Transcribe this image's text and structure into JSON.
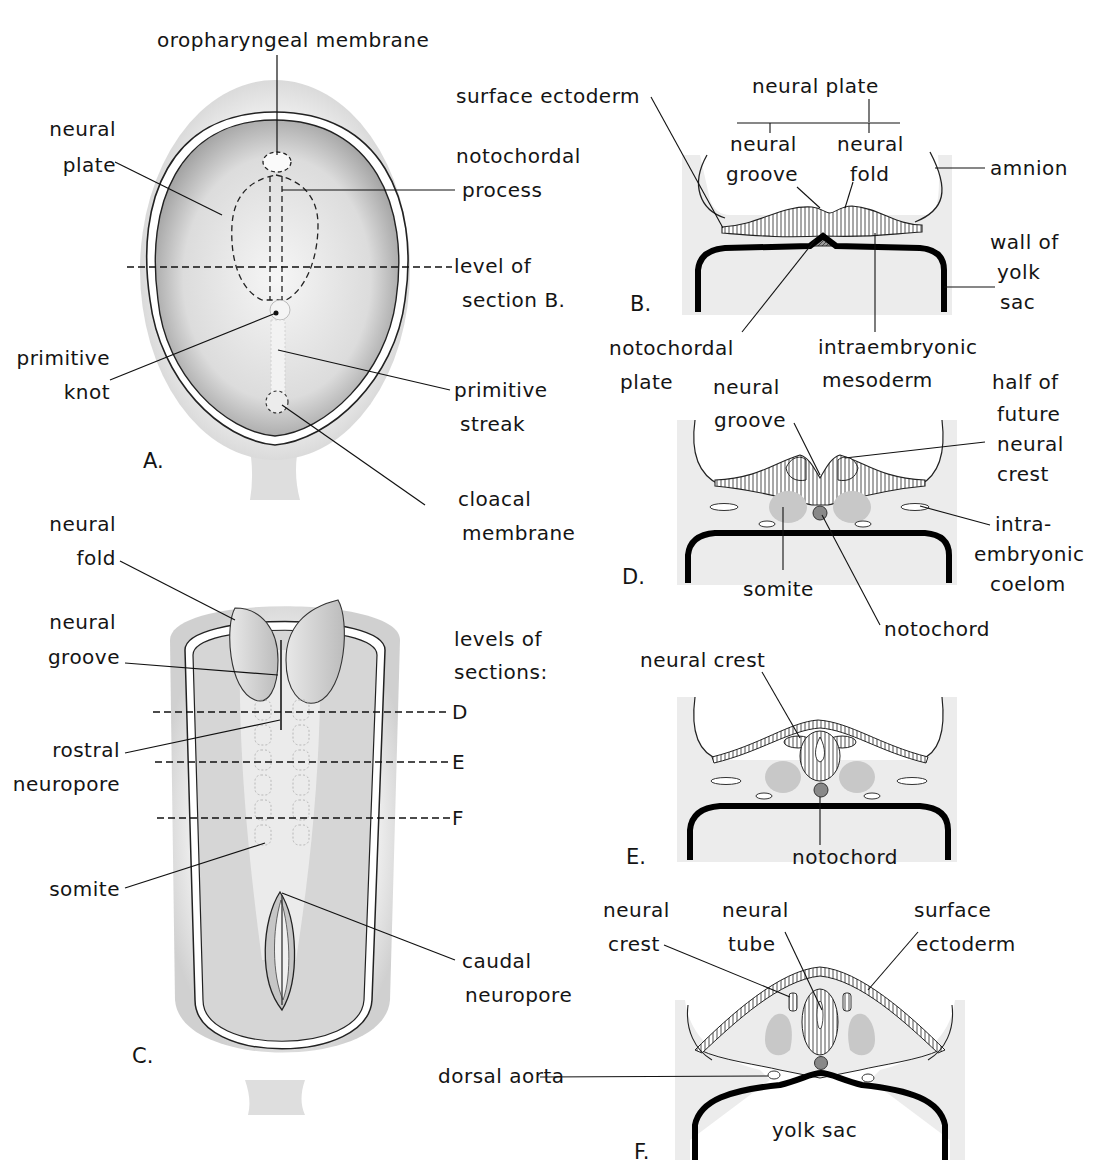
{
  "figure": {
    "colors": {
      "ink": "#141414",
      "stipple": "#bdbdbd",
      "mesoderm": "#e3e3e3",
      "somite": "#c8c8c8",
      "notochord": "#888888",
      "endoderm": "#000000",
      "background": "#ffffff"
    }
  },
  "panels": {
    "A": {
      "letter": "A.",
      "labels": {
        "oropharyngeal_membrane": "oropharyngeal membrane",
        "neural_plate_1": "neural",
        "neural_plate_2": "plate",
        "notochordal_process_1": "notochordal",
        "notochordal_process_2": "process",
        "level_of_1": "level of",
        "level_of_2": "section B.",
        "primitive_knot_1": "primitive",
        "primitive_knot_2": "knot",
        "primitive_streak_1": "primitive",
        "primitive_streak_2": "streak",
        "cloacal_membrane_1": "cloacal",
        "cloacal_membrane_2": "membrane"
      }
    },
    "B": {
      "letter": "B.",
      "labels": {
        "surface_ectoderm": "surface ectoderm",
        "neural_plate": "neural plate",
        "neural_groove_1": "neural",
        "neural_groove_2": "groove",
        "neural_fold_1": "neural",
        "neural_fold_2": "fold",
        "amnion": "amnion",
        "wall_of_yolk_sac_1": "wall of",
        "wall_of_yolk_sac_2": "yolk",
        "wall_of_yolk_sac_3": "sac",
        "notochordal_plate_1": "notochordal",
        "notochordal_plate_2": "plate",
        "intraembryonic_mesoderm_1": "intraembryonic",
        "intraembryonic_mesoderm_2": "mesoderm"
      }
    },
    "C": {
      "letter": "C.",
      "labels": {
        "neural_fold_1": "neural",
        "neural_fold_2": "fold",
        "neural_groove_1": "neural",
        "neural_groove_2": "groove",
        "levels_1": "levels of",
        "levels_2": "sections:",
        "level_D": "D",
        "level_E": "E",
        "level_F": "F",
        "rostral_neuropore_1": "rostral",
        "rostral_neuropore_2": "neuropore",
        "somite": "somite",
        "caudal_neuropore_1": "caudal",
        "caudal_neuropore_2": "neuropore"
      }
    },
    "D": {
      "letter": "D.",
      "labels": {
        "neural_groove_1": "neural",
        "neural_groove_2": "groove",
        "neural_crest_1": "half of",
        "neural_crest_2": "future",
        "neural_crest_3": "neural",
        "neural_crest_4": "crest",
        "coelom_1": "intra-",
        "coelom_2": "embryonic",
        "coelom_3": "coelom",
        "somite": "somite",
        "notochord": "notochord"
      }
    },
    "E": {
      "letter": "E.",
      "labels": {
        "neural_crest": "neural crest",
        "notochord": "notochord"
      }
    },
    "F": {
      "letter": "F.",
      "labels": {
        "neural_crest_1": "neural",
        "neural_crest_2": "crest",
        "neural_tube_1": "neural",
        "neural_tube_2": "tube",
        "surface_ectoderm_1": "surface",
        "surface_ectoderm_2": "ectoderm",
        "dorsal_aorta": "dorsal aorta",
        "yolk_sac": "yolk sac"
      }
    }
  }
}
